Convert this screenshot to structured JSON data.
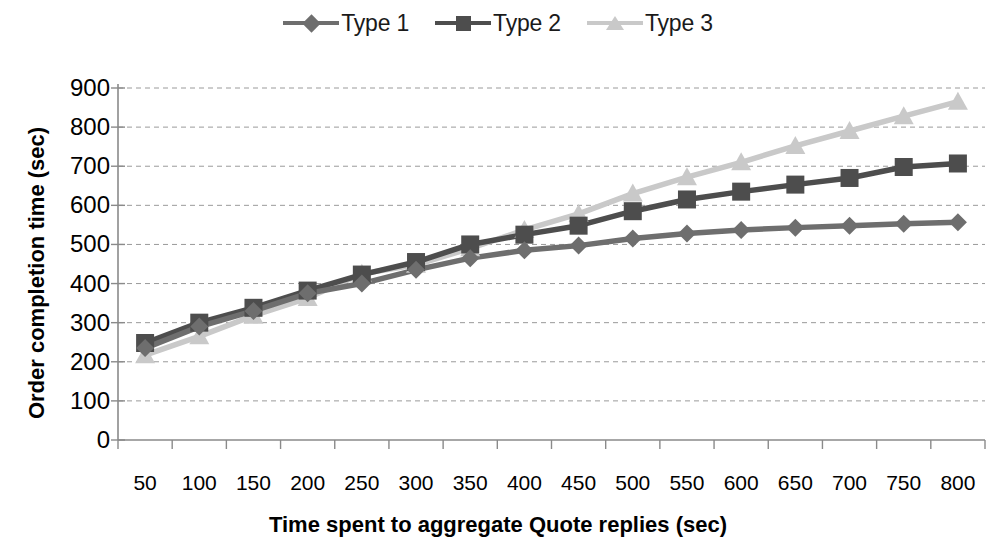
{
  "chart_data": {
    "type": "line",
    "title": "",
    "xlabel": "Time spent to aggregate Quote replies (sec)",
    "ylabel": "Order completion time (sec)",
    "categories": [
      50,
      100,
      150,
      200,
      250,
      300,
      350,
      400,
      450,
      500,
      550,
      600,
      650,
      700,
      750,
      800
    ],
    "xtick_labels": [
      "50",
      "100",
      "150",
      "200",
      "250",
      "300",
      "350",
      "400",
      "450",
      "500",
      "550",
      "600",
      "650",
      "700",
      "750",
      "800"
    ],
    "ytick_labels": [
      "0",
      "100",
      "200",
      "300",
      "400",
      "500",
      "600",
      "700",
      "800",
      "900"
    ],
    "ytick_values": [
      0,
      100,
      200,
      300,
      400,
      500,
      600,
      700,
      800,
      900
    ],
    "ylim": [
      0,
      900
    ],
    "grid": true,
    "legend_position": "top-center",
    "series": [
      {
        "name": "Type 1",
        "marker": "diamond",
        "color": "#6e6e6e",
        "values": [
          235,
          290,
          330,
          375,
          400,
          435,
          465,
          485,
          497,
          515,
          528,
          537,
          543,
          548,
          553,
          557
        ]
      },
      {
        "name": "Type 2",
        "marker": "square",
        "color": "#4d4d4d",
        "values": [
          248,
          300,
          338,
          382,
          423,
          455,
          500,
          525,
          548,
          585,
          615,
          635,
          653,
          670,
          698,
          707
        ]
      },
      {
        "name": "Type 3",
        "marker": "triangle",
        "color": "#c9c9c9",
        "values": [
          217,
          265,
          318,
          363,
          425,
          448,
          490,
          537,
          578,
          630,
          672,
          710,
          752,
          790,
          828,
          865
        ]
      }
    ]
  }
}
